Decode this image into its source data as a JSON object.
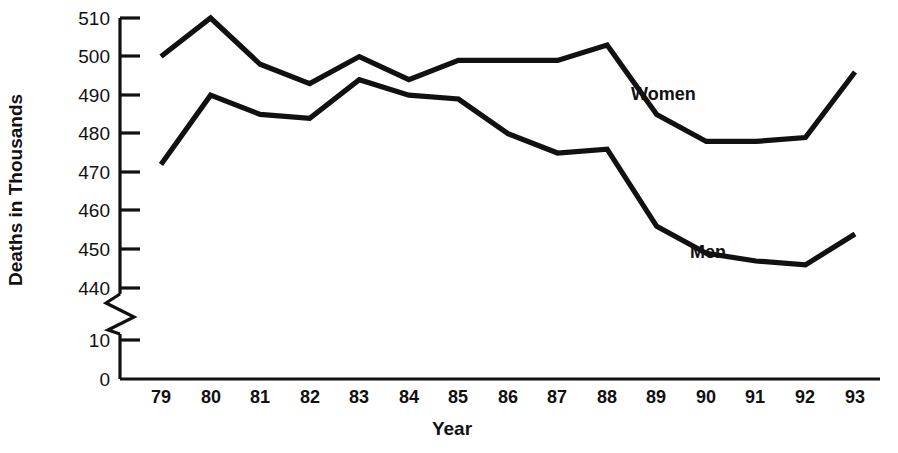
{
  "chart_data": {
    "type": "line",
    "title": "",
    "xlabel": "Year",
    "ylabel": "Deaths in Thousands",
    "x": [
      "79",
      "80",
      "81",
      "82",
      "83",
      "84",
      "85",
      "86",
      "87",
      "88",
      "89",
      "90",
      "91",
      "92",
      "93"
    ],
    "categories": [
      "79",
      "80",
      "81",
      "82",
      "83",
      "84",
      "85",
      "86",
      "87",
      "88",
      "89",
      "90",
      "91",
      "92",
      "93"
    ],
    "series": [
      {
        "name": "Women",
        "label": "Women",
        "values": [
          500,
          510,
          498,
          493,
          500,
          494,
          499,
          499,
          499,
          503,
          485,
          478,
          478,
          479,
          496
        ]
      },
      {
        "name": "Men",
        "label": "Men",
        "values": [
          472,
          490,
          485,
          484,
          494,
          490,
          489,
          480,
          475,
          476,
          456,
          449,
          447,
          446,
          454
        ]
      }
    ],
    "ylim": [
      0,
      510
    ],
    "y_ticks": [
      0,
      10,
      440,
      450,
      460,
      470,
      480,
      490,
      500,
      510
    ],
    "y_tick_labels": [
      "0",
      "10",
      "440",
      "450",
      "460",
      "470",
      "480",
      "490",
      "500",
      "510"
    ],
    "axis_break": {
      "present": true,
      "between": [
        10,
        440
      ],
      "style": "zigzag"
    },
    "grid": false,
    "legend": "inline-annotations",
    "line_color": "#111111",
    "background_color": "#ffffff"
  },
  "axes": {
    "y_title": "Deaths in Thousands",
    "x_title": "Year",
    "y_tick_labels": [
      "510",
      "500",
      "490",
      "480",
      "470",
      "460",
      "450",
      "440",
      "10",
      "0"
    ],
    "x_tick_labels": [
      "79",
      "80",
      "81",
      "82",
      "83",
      "84",
      "85",
      "86",
      "87",
      "88",
      "89",
      "90",
      "91",
      "92",
      "93"
    ]
  },
  "annotations": {
    "women_label": "Women",
    "men_label": "Men"
  }
}
